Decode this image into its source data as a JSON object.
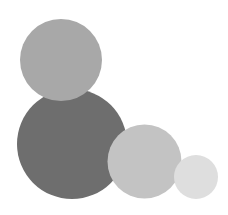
{
  "image": {
    "background": "#ffffff",
    "circles": [
      {
        "name": "dark-circle",
        "cx": 72,
        "cy": 144,
        "r": 55,
        "color": "#6e6e6e"
      },
      {
        "name": "top-circle",
        "cx": 61,
        "cy": 60,
        "r": 41,
        "color": "#a8a8a8"
      },
      {
        "name": "medium-circle",
        "cx": 144.5,
        "cy": 161.5,
        "r": 37,
        "color": "#c3c3c3"
      },
      {
        "name": "small-circle",
        "cx": 196,
        "cy": 177,
        "r": 22,
        "color": "#dedede"
      }
    ]
  }
}
